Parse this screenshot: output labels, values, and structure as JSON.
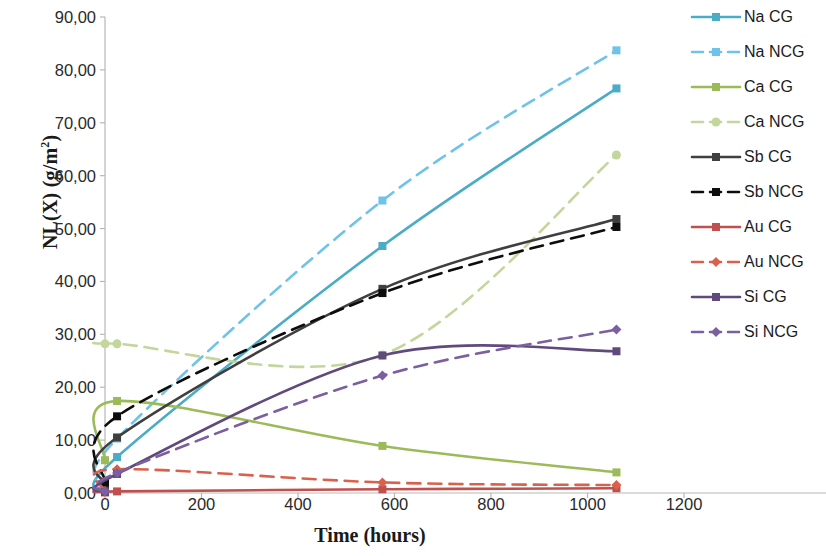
{
  "chart_data": {
    "type": "line",
    "title": "",
    "xlabel": "Time (hours)",
    "ylabel": "NL(X)  (g/m²)",
    "ylabel_main": "NL(X)  (g/m",
    "ylabel_sup": "2",
    "ylabel_tail": ")",
    "xlim": [
      0,
      1200
    ],
    "ylim": [
      0,
      90
    ],
    "x_ticks": [
      "0",
      "200",
      "400",
      "600",
      "800",
      "1000",
      "1200"
    ],
    "x_tick_values": [
      0,
      200,
      400,
      600,
      800,
      1000,
      1200
    ],
    "y_ticks": [
      "0,00",
      "10,00",
      "20,00",
      "30,00",
      "40,00",
      "50,00",
      "60,00",
      "70,00",
      "80,00",
      "90,00"
    ],
    "y_tick_values": [
      0,
      10,
      20,
      30,
      40,
      50,
      60,
      70,
      80,
      90
    ],
    "grid": false,
    "legend_position": "right",
    "decimal_separator": ",",
    "series": [
      {
        "name": "Na CG",
        "color": "#4BACC6",
        "dash": "solid",
        "marker": "square",
        "x": [
          0,
          25,
          575,
          1060
        ],
        "values": [
          0.6,
          6.8,
          46.7,
          76.5
        ]
      },
      {
        "name": "Na NCG",
        "color": "#6FC3E8",
        "dash": "dashed",
        "marker": "square",
        "x": [
          0,
          25,
          575,
          1060
        ],
        "values": [
          1.0,
          10.3,
          55.3,
          83.7
        ]
      },
      {
        "name": "Ca CG",
        "color": "#9BBB59",
        "dash": "solid",
        "marker": "square",
        "x": [
          0,
          25,
          575,
          1060
        ],
        "values": [
          6.2,
          17.4,
          8.9,
          3.9
        ]
      },
      {
        "name": "Ca NCG",
        "color": "#C3D69B",
        "dash": "dashed",
        "marker": "circle",
        "x": [
          0,
          25,
          575,
          1060
        ],
        "values": [
          28.2,
          28.2,
          26.1,
          63.9
        ]
      },
      {
        "name": "Sb CG",
        "color": "#3F3F3F",
        "dash": "solid",
        "marker": "square",
        "x": [
          0,
          25,
          575,
          1060
        ],
        "values": [
          1.5,
          10.5,
          38.6,
          51.8
        ]
      },
      {
        "name": "Sb NCG",
        "color": "#0D0D0D",
        "dash": "dashed",
        "marker": "square",
        "x": [
          0,
          25,
          575,
          1060
        ],
        "values": [
          2.0,
          14.5,
          37.8,
          50.3
        ]
      },
      {
        "name": "Au CG",
        "color": "#C0504D",
        "dash": "solid",
        "marker": "square",
        "x": [
          0,
          25,
          575,
          1060
        ],
        "values": [
          0.1,
          0.3,
          0.7,
          0.9
        ]
      },
      {
        "name": "Au NCG",
        "color": "#D9604C",
        "dash": "dashed",
        "marker": "diamond",
        "x": [
          0,
          25,
          575,
          1060
        ],
        "values": [
          0.4,
          4.5,
          2.0,
          1.5
        ]
      },
      {
        "name": "Si CG",
        "color": "#604A7B",
        "dash": "solid",
        "marker": "square",
        "x": [
          0,
          25,
          575,
          1060
        ],
        "values": [
          0.2,
          3.6,
          26.0,
          26.8
        ]
      },
      {
        "name": "Si NCG",
        "color": "#7B5FA0",
        "dash": "dashed",
        "marker": "diamond",
        "x": [
          0,
          25,
          575,
          1060
        ],
        "values": [
          0.3,
          3.8,
          22.2,
          30.9
        ]
      }
    ]
  },
  "legend": {
    "items": [
      {
        "label": "Na CG"
      },
      {
        "label": "Na NCG"
      },
      {
        "label": "Ca CG"
      },
      {
        "label": "Ca NCG"
      },
      {
        "label": "Sb CG"
      },
      {
        "label": "Sb NCG"
      },
      {
        "label": "Au CG"
      },
      {
        "label": "Au NCG"
      },
      {
        "label": "Si CG"
      },
      {
        "label": "Si NCG"
      }
    ]
  }
}
